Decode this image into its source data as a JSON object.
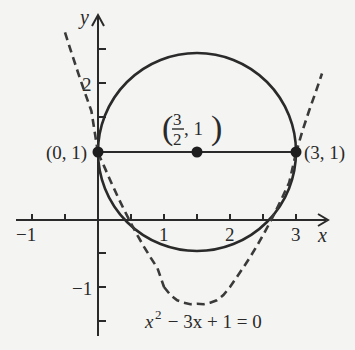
{
  "axes": {
    "x_label": "x",
    "y_label": "y",
    "x_ticks": [
      {
        "value": -1,
        "label": "−1"
      },
      {
        "value": 1,
        "label": "1"
      },
      {
        "value": 2,
        "label": "2"
      },
      {
        "value": 3,
        "label": "3"
      }
    ],
    "y_ticks": [
      {
        "value": 2,
        "label": "2"
      },
      {
        "value": -1,
        "label": "−1"
      }
    ]
  },
  "points": {
    "left": {
      "label": "(0, 1)"
    },
    "center": {
      "label_num": "3",
      "label_den": "2",
      "label_rest": ", 1"
    },
    "right": {
      "label": "(3, 1)"
    }
  },
  "equation": {
    "base": "x",
    "exp": "2",
    "rest": " − 3x + 1 = 0"
  },
  "colors": {
    "ink": "#2a2a2a",
    "background": "#f4f4f2"
  }
}
